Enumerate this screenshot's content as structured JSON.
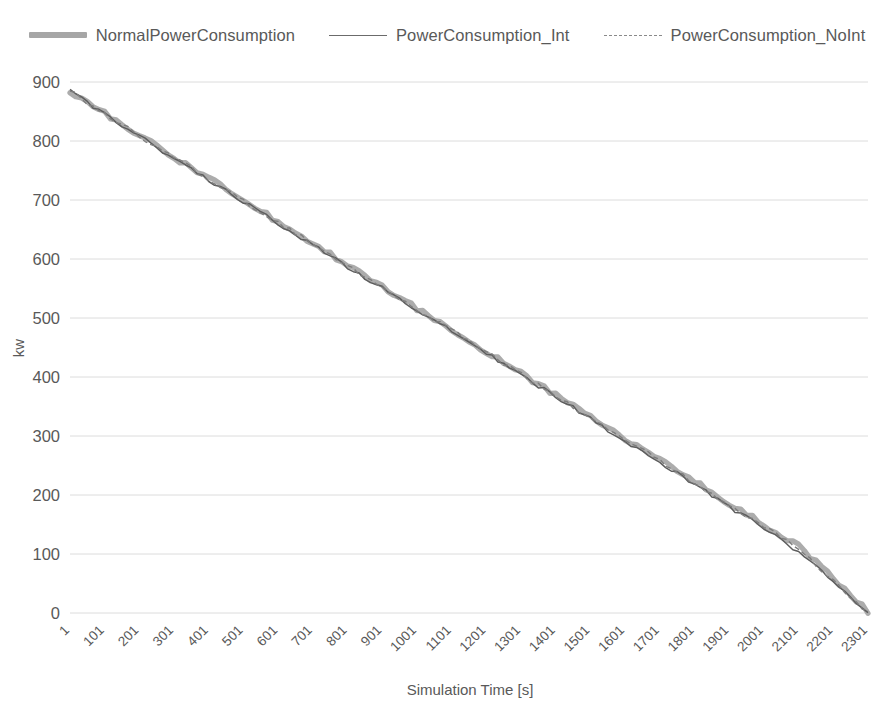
{
  "chart_data": {
    "type": "line",
    "title": "",
    "xlabel": "Simulation Time [s]",
    "ylabel": "kw",
    "xlim": [
      1,
      2301
    ],
    "ylim": [
      0,
      900
    ],
    "ytick_step": 100,
    "xtick_step": 100,
    "grid": "horizontal",
    "legend_position": "top-center",
    "categories": [
      1,
      101,
      201,
      301,
      401,
      501,
      601,
      701,
      801,
      901,
      1001,
      1101,
      1201,
      1301,
      1401,
      1501,
      1601,
      1701,
      1801,
      1901,
      2001,
      2101,
      2201,
      2301
    ],
    "ytick_labels": [
      "900",
      "800",
      "700",
      "600",
      "500",
      "400",
      "300",
      "200",
      "100",
      "0"
    ],
    "ytick_values": [
      900,
      800,
      700,
      600,
      500,
      400,
      300,
      200,
      100,
      0
    ],
    "xtick_labels": [
      "1",
      "101",
      "201",
      "301",
      "401",
      "501",
      "601",
      "701",
      "801",
      "901",
      "1001",
      "1101",
      "1201",
      "1301",
      "1401",
      "1501",
      "1601",
      "1701",
      "1801",
      "1901",
      "2001",
      "2101",
      "2201",
      "2301"
    ],
    "series": [
      {
        "name": "NormalPowerConsumption",
        "style": "thick-solid",
        "color": "#a8a8a8",
        "values": [
          885,
          847,
          810,
          772,
          737,
          700,
          663,
          627,
          590,
          553,
          516,
          480,
          443,
          406,
          370,
          333,
          296,
          260,
          223,
          186,
          150,
          113,
          60,
          2
        ]
      },
      {
        "name": "PowerConsumption_Int",
        "style": "solid",
        "color": "#5d5d5d",
        "values": [
          884,
          845,
          808,
          770,
          734,
          697,
          660,
          624,
          587,
          550,
          513,
          477,
          440,
          403,
          366,
          329,
          292,
          255,
          218,
          180,
          143,
          104,
          52,
          0
        ]
      },
      {
        "name": "PowerConsumption_NoInt",
        "style": "dashed",
        "color": "#7d7d7d",
        "values": [
          885,
          846,
          809,
          771,
          736,
          699,
          662,
          626,
          589,
          552,
          515,
          479,
          442,
          405,
          368,
          331,
          294,
          258,
          221,
          184,
          147,
          109,
          56,
          1
        ]
      }
    ]
  },
  "legend": {
    "items": [
      {
        "label": "NormalPowerConsumption",
        "marker": "thick-line-marker"
      },
      {
        "label": "PowerConsumption_Int",
        "marker": "solid-line-marker"
      },
      {
        "label": "PowerConsumption_NoInt",
        "marker": "dashed-line-marker"
      }
    ]
  },
  "axes": {
    "x_title": "Simulation Time [s]",
    "y_title": "kw"
  }
}
